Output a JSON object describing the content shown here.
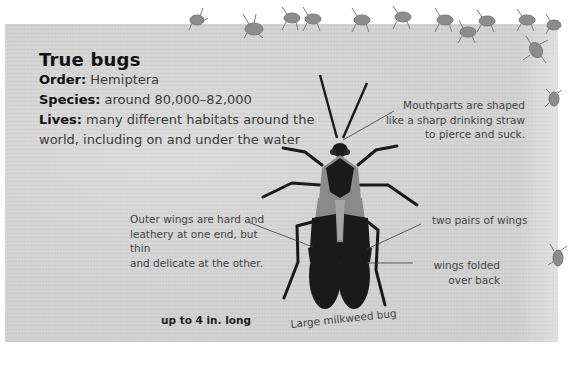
{
  "header": {
    "title": "True bugs"
  },
  "facts": [
    {
      "label": "Order:",
      "value": " Hemiptera"
    },
    {
      "label": "Species:",
      "value": " around 80,000–82,000"
    },
    {
      "label": "Lives:",
      "value": " many different habitats around the"
    },
    {
      "label": "",
      "value": "world, including on and under the water"
    }
  ],
  "annotations": {
    "mouthparts": [
      "Mouthparts are shaped",
      "like a sharp drinking straw",
      "to pierce and suck."
    ],
    "outer_wings": [
      "Outer wings are hard and",
      "leathery at one end, but thin",
      "and delicate at the other."
    ],
    "two_pairs": "two pairs of wings",
    "folded": [
      "wings folded",
      "over back"
    ]
  },
  "size_label": "up to 4 in. long",
  "specimen_caption": "Large milkweed bug",
  "colors": {
    "panel": "#d4d4d4",
    "text_dark": "#111111",
    "text_body": "#3a3a3a",
    "bug_body": "#1a1a1a",
    "bug_wing_light": "#8a8a8a",
    "small_bugs": "#8c8c8c"
  }
}
